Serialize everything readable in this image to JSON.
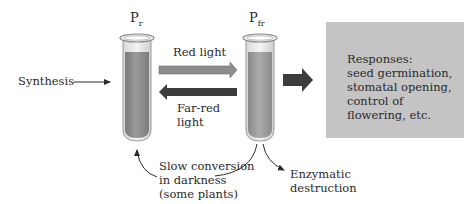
{
  "diagram": {
    "tubes": [
      {
        "id": "pr",
        "label_main": "P",
        "label_sub": "r",
        "fill_color": "#8a8a8a"
      },
      {
        "id": "pfr",
        "label_main": "P",
        "label_sub": "fr",
        "fill_color": "#9a9a9a"
      }
    ],
    "arrows": {
      "synthesis": {
        "label": "Synthesis"
      },
      "red_light": {
        "label": "Red light",
        "color": "#8c8c8c"
      },
      "far_red_light": {
        "label_line1": "Far-red",
        "label_line2": "light",
        "color": "#3c3c3c"
      },
      "to_responses": {
        "color": "#3c3c3c"
      },
      "slow_conversion": {
        "line1": "Slow conversion",
        "line2": "in darkness",
        "line3": "(some plants)"
      },
      "enzymatic": {
        "line1": "Enzymatic",
        "line2": "destruction"
      }
    },
    "responses_box": {
      "line1": "Responses:",
      "line2": "seed germination,",
      "line3": "stomatal opening,",
      "line4": "control of",
      "line5": "flowering, etc.",
      "color": "#c4c4c4"
    }
  }
}
